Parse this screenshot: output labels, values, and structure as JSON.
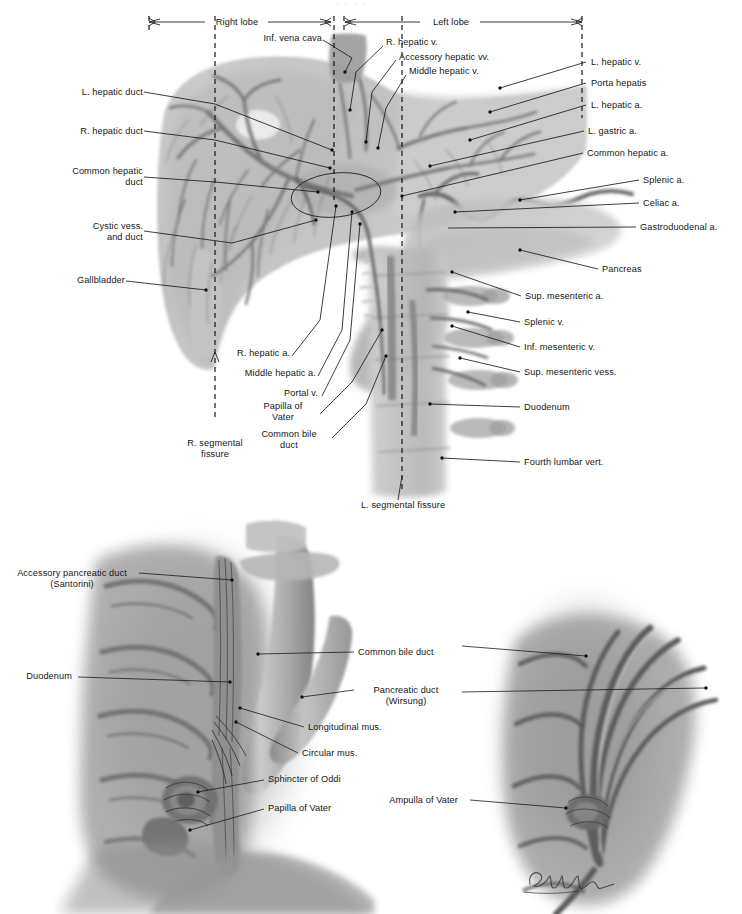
{
  "plate": {
    "title_artifact": "· ·   ·  ·",
    "signature": "L. Schlossberg",
    "ink_color": "#1b1b1b",
    "page_background": "#ffffff"
  },
  "figure_top": {
    "name": "liver-biliary-vascular-anatomy",
    "dimension_bars": [
      {
        "label": "Right lobe",
        "x1": 147,
        "x2": 333,
        "y": 22
      },
      {
        "label": "Left lobe",
        "x1": 343,
        "x2": 584,
        "y": 22
      }
    ],
    "fissure_markers": [
      {
        "label": "R. segmental fissure",
        "x": 215,
        "line_top": 28,
        "line_bottom": 424
      },
      {
        "label": "L. segmental fissure",
        "x": 402,
        "line_top": 28,
        "line_bottom": 492
      }
    ],
    "labels_left": [
      {
        "text": "L. hepatic duct",
        "x": 62,
        "y": 93
      },
      {
        "text": "R. hepatic duct",
        "x": 62,
        "y": 132
      },
      {
        "text": "Common hepatic",
        "x": 69,
        "y": 172,
        "text2": "duct"
      },
      {
        "text": "Cystic vess.",
        "x": 66,
        "y": 227,
        "text2": "and duct"
      },
      {
        "text": "Gallbladder",
        "x": 69,
        "y": 281
      },
      {
        "text": "R. segmental",
        "x": 180,
        "y": 444,
        "text2": "fissure"
      }
    ],
    "labels_inner": [
      {
        "text": "Inf. vena cava",
        "x": 252,
        "y": 38
      },
      {
        "text": "R. hepatic v.",
        "x": 386,
        "y": 42
      },
      {
        "text": "Accessory hepatic vv.",
        "x": 399,
        "y": 57
      },
      {
        "text": "Middle hepatic v.",
        "x": 409,
        "y": 71
      },
      {
        "text": "R. hepatic a.",
        "x": 234,
        "y": 353
      },
      {
        "text": "Middle hepatic a.",
        "x": 247,
        "y": 373
      },
      {
        "text": "Portal v.",
        "x": 286,
        "y": 393
      },
      {
        "text": "Papilla of",
        "x": 284,
        "y": 406,
        "text2": "Vater"
      },
      {
        "text": "Common bile",
        "x": 277,
        "y": 434,
        "text2": "duct"
      },
      {
        "text": "L. segmental fissure",
        "x": 363,
        "y": 504
      }
    ],
    "labels_right": [
      {
        "text": "L. hepatic v.",
        "x": 591,
        "y": 62
      },
      {
        "text": "Porta hepatis",
        "x": 591,
        "y": 83
      },
      {
        "text": "L. hepatic a.",
        "x": 591,
        "y": 105
      },
      {
        "text": "L. gastric a.",
        "x": 588,
        "y": 131
      },
      {
        "text": "Common hepatic a.",
        "x": 587,
        "y": 153
      },
      {
        "text": "Splenic a.",
        "x": 643,
        "y": 180
      },
      {
        "text": "Celiac a.",
        "x": 643,
        "y": 203
      },
      {
        "text": "Gastroduodenal a.",
        "x": 640,
        "y": 227
      },
      {
        "text": "Pancreas",
        "x": 602,
        "y": 269
      },
      {
        "text": "Sup. mesenteric a.",
        "x": 525,
        "y": 296
      },
      {
        "text": "Splenic v.",
        "x": 524,
        "y": 322
      },
      {
        "text": "Inf. mesenteric v.",
        "x": 524,
        "y": 347
      },
      {
        "text": "Sup. mesenteric vess.",
        "x": 524,
        "y": 372
      },
      {
        "text": "Duodenum",
        "x": 524,
        "y": 407
      },
      {
        "text": "Fourth lumbar vert.",
        "x": 524,
        "y": 462
      }
    ]
  },
  "figure_bottom_left": {
    "name": "duodenal-papilla-sphincter-detail",
    "labels_left": [
      {
        "text": "Accessory pancreatic duct",
        "x": 14,
        "y": 573,
        "text2": "(Santorini)"
      },
      {
        "text": "Duodenum",
        "x": 20,
        "y": 676
      }
    ],
    "labels_right": [
      {
        "text": "Common bile duct",
        "x": 358,
        "y": 652
      },
      {
        "text": "Pancreatic duct",
        "x": 358,
        "y": 690,
        "text2": "(Wirsung)"
      },
      {
        "text": "Longitudinal mus.",
        "x": 308,
        "y": 727
      },
      {
        "text": "Circular mus.",
        "x": 302,
        "y": 753
      },
      {
        "text": "Sphincter of Oddi",
        "x": 268,
        "y": 779
      },
      {
        "text": "Papilla of Vater",
        "x": 268,
        "y": 808
      }
    ]
  },
  "figure_bottom_right": {
    "name": "ampulla-of-vater-detail",
    "labels": [
      {
        "text": "Ampulla of Vater",
        "x": 392,
        "y": 800
      }
    ]
  }
}
